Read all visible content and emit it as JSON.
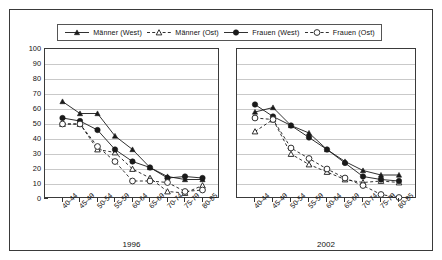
{
  "legend": {
    "items": [
      {
        "label": "Männer (West)",
        "marker": "triangle-filled",
        "line": "solid",
        "color": "#1a1a1a"
      },
      {
        "label": "Männer (Ost)",
        "marker": "triangle-open",
        "line": "dashed",
        "color": "#1a1a1a"
      },
      {
        "label": "Frauen (West)",
        "marker": "circle-filled",
        "line": "solid",
        "color": "#1a1a1a"
      },
      {
        "label": "Frauen (Ost)",
        "marker": "circle-open",
        "line": "dashed",
        "color": "#1a1a1a"
      }
    ]
  },
  "axis": {
    "y_ticks": [
      100,
      90,
      80,
      70,
      60,
      50,
      40,
      30,
      20,
      10,
      0
    ],
    "y_min": 0,
    "y_max": 100
  },
  "chart_data": [
    {
      "type": "line",
      "title": "1996",
      "xlabel": "",
      "ylabel": "",
      "ylim": [
        0,
        100
      ],
      "grid": true,
      "legend_position": "top",
      "categories": [
        "40-44",
        "45-49",
        "50-54",
        "55-59",
        "60-64",
        "65-69",
        "70-74",
        "75-79",
        "80-85"
      ],
      "series": [
        {
          "name": "Männer (West)",
          "marker": "triangle-filled",
          "line": "solid",
          "values": [
            65,
            57,
            57,
            42,
            33,
            21,
            15,
            13,
            13
          ]
        },
        {
          "name": "Männer (Ost)",
          "marker": "triangle-open",
          "line": "dashed",
          "values": [
            50,
            50,
            33,
            31,
            20,
            14,
            5,
            4,
            9
          ]
        },
        {
          "name": "Frauen (West)",
          "marker": "circle-filled",
          "line": "solid",
          "values": [
            54,
            52,
            46,
            33,
            25,
            21,
            14,
            15,
            14
          ]
        },
        {
          "name": "Frauen (Ost)",
          "marker": "circle-open",
          "line": "dashed",
          "values": [
            50,
            50,
            35,
            25,
            12,
            12,
            11,
            5,
            6
          ]
        }
      ]
    },
    {
      "type": "line",
      "title": "2002",
      "xlabel": "",
      "ylabel": "",
      "ylim": [
        0,
        100
      ],
      "grid": true,
      "legend_position": "top",
      "categories": [
        "40-44",
        "45-49",
        "50-54",
        "55-59",
        "60-64",
        "65-69",
        "70-74",
        "75-79",
        "80-85"
      ],
      "series": [
        {
          "name": "Männer (West)",
          "marker": "triangle-filled",
          "line": "solid",
          "values": [
            58,
            61,
            49,
            44,
            33,
            25,
            19,
            16,
            16
          ]
        },
        {
          "name": "Männer (Ost)",
          "marker": "triangle-open",
          "line": "dashed",
          "values": [
            45,
            53,
            30,
            23,
            18,
            13,
            11,
            12,
            11
          ]
        },
        {
          "name": "Frauen (West)",
          "marker": "circle-filled",
          "line": "solid",
          "values": [
            63,
            55,
            49,
            41,
            33,
            24,
            15,
            13,
            12
          ]
        },
        {
          "name": "Frauen (Ost)",
          "marker": "circle-open",
          "line": "dashed",
          "values": [
            54,
            53,
            34,
            27,
            20,
            14,
            9,
            3,
            1
          ]
        }
      ]
    }
  ]
}
